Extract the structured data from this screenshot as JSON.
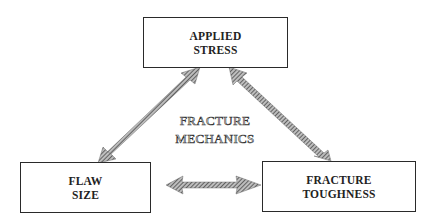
{
  "diagram": {
    "center_label": {
      "line1": "FRACTURE",
      "line2": "MECHANICS"
    },
    "nodes": [
      {
        "id": "applied-stress",
        "line1": "APPLIED",
        "line2": "STRESS"
      },
      {
        "id": "flaw-size",
        "line1": "FLAW",
        "line2": "SIZE"
      },
      {
        "id": "fracture-toughness",
        "line1": "FRACTURE",
        "line2": "TOUGHNESS"
      }
    ],
    "edges": [
      {
        "from": "flaw-size",
        "to": "applied-stress",
        "style": "double-headed hatched arrow"
      },
      {
        "from": "applied-stress",
        "to": "fracture-toughness",
        "style": "double-headed hatched arrow"
      },
      {
        "from": "flaw-size",
        "to": "fracture-toughness",
        "style": "double-headed hatched arrow"
      }
    ],
    "colors": {
      "border": "#2a2a2a",
      "arrow_fill": "#8a8a8a",
      "text": "#222222",
      "background": "#ffffff"
    }
  }
}
